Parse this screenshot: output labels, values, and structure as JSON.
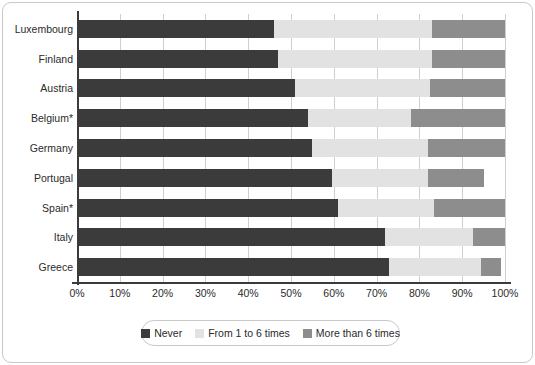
{
  "chart_data": {
    "type": "bar",
    "orientation": "horizontal",
    "stacked": true,
    "stack_total": 100,
    "title": "",
    "subtitle": "",
    "xlabel": "",
    "ylabel": "",
    "xlim": [
      0,
      100
    ],
    "grid": true,
    "legend_position": "bottom",
    "units": "%",
    "categories": [
      "Luxembourg",
      "Finland",
      "Austria",
      "Belgium*",
      "Germany",
      "Portugal",
      "Spain*",
      "Italy",
      "Greece"
    ],
    "xticks": [
      0,
      10,
      20,
      30,
      40,
      50,
      60,
      70,
      80,
      90,
      100
    ],
    "xticklabels": [
      "0%",
      "10%",
      "20%",
      "30%",
      "40%",
      "50%",
      "60%",
      "70%",
      "80%",
      "90%",
      "100%"
    ],
    "series": [
      {
        "name": "Never",
        "color": "#3b3b3b",
        "values": [
          46,
          47,
          51,
          54,
          55,
          59.5,
          61,
          72,
          73
        ]
      },
      {
        "name": "From 1 to 6 times",
        "color": "#e2e2e2",
        "values": [
          37,
          36,
          31.5,
          24,
          27,
          22.5,
          22.5,
          20.5,
          21.5
        ]
      },
      {
        "name": "More than 6 times",
        "color": "#8d8d8d",
        "values": [
          17,
          17,
          17.5,
          22,
          18,
          13,
          16.5,
          7.5,
          4.5
        ]
      }
    ]
  },
  "legend": {
    "items": [
      {
        "label": "Never",
        "color": "#3b3b3b"
      },
      {
        "label": "From 1 to 6 times",
        "color": "#e2e2e2"
      },
      {
        "label": "More than 6 times",
        "color": "#8d8d8d"
      }
    ]
  }
}
